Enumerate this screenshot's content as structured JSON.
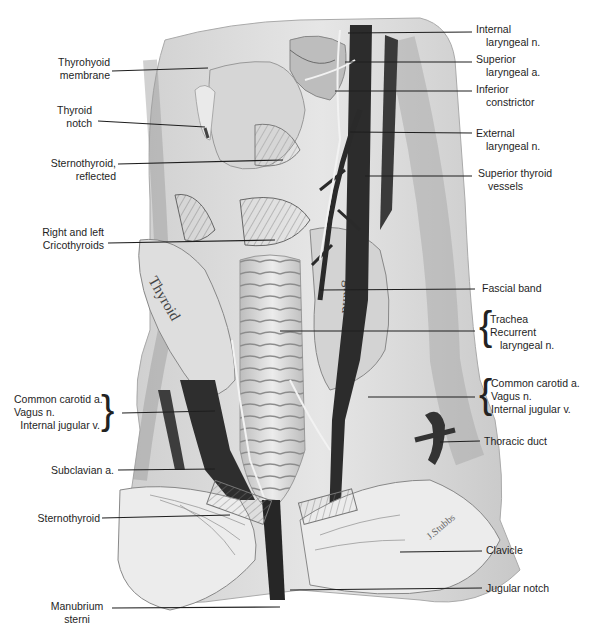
{
  "figure": {
    "gland_text": [
      "Thyroid",
      "gland"
    ],
    "signature": "J.Stubbs"
  },
  "labels_left": [
    {
      "id": "thyrohyoid-membrane",
      "line1": "Thyrohyoid",
      "line2": "membrane"
    },
    {
      "id": "thyroid-notch",
      "line1": "Thyroid",
      "line2": "notch"
    },
    {
      "id": "sternothyroid-reflected",
      "line1": "Sternothyroid,",
      "line2": "reflected"
    },
    {
      "id": "cricothyroids",
      "line1": "Right and left",
      "line2": "Cricothyroids"
    },
    {
      "id": "left-carotid-group",
      "line1": "Common carotid a.",
      "line2": "Vagus n.",
      "line3": "Internal jugular v."
    },
    {
      "id": "subclavian",
      "line1": "Subclavian a."
    },
    {
      "id": "sternothyroid",
      "line1": "Sternothyroid"
    },
    {
      "id": "manubrium",
      "line1": "Manubrium",
      "line2": "sterni"
    }
  ],
  "labels_right": [
    {
      "id": "internal-laryngeal",
      "line1": "Internal",
      "line2": "laryngeal n."
    },
    {
      "id": "superior-laryngeal",
      "line1": "Superior",
      "line2": "laryngeal a."
    },
    {
      "id": "inferior-constrictor",
      "line1": "Inferior",
      "line2": "constrictor"
    },
    {
      "id": "external-laryngeal",
      "line1": "External",
      "line2": "laryngeal n."
    },
    {
      "id": "superior-thyroid",
      "line1": "Superior thyroid",
      "line2": "vessels"
    },
    {
      "id": "fascial-band",
      "line1": "Fascial band"
    },
    {
      "id": "trachea-group",
      "line1": "Trachea",
      "line2": "Recurrent",
      "line3": "laryngeal n."
    },
    {
      "id": "right-carotid-group",
      "line1": "Common carotid a.",
      "line2": "Vagus n.",
      "line3": "Internal jugular v."
    },
    {
      "id": "thoracic-duct",
      "line1": "Thoracic duct"
    },
    {
      "id": "clavicle",
      "line1": "Clavicle"
    },
    {
      "id": "jugular-notch",
      "line1": "Jugular notch"
    }
  ],
  "colors": {
    "background": "#ffffff",
    "tissue_light": "#e2e2e2",
    "tissue_mid": "#b9b9b9",
    "vessel_dark": "#2c2c2c",
    "leader": "#1e1e1e"
  }
}
